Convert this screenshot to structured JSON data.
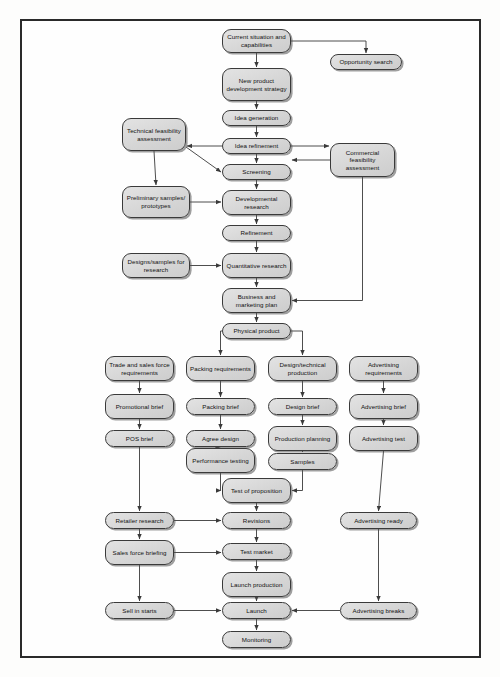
{
  "diagram": {
    "style": {
      "node_fill": "#d8d8d8",
      "node_border": "#3a3a3a",
      "frame_border": "#2a2a2a",
      "page_background": "#fdfdfc",
      "connector": "#3a3a3a"
    },
    "nodes": [
      {
        "id": "current_situation",
        "label": "Current situation and capabilities",
        "x": 222,
        "y": 29,
        "w": 69,
        "h": 24
      },
      {
        "id": "opportunity_search",
        "label": "Opportunity search",
        "x": 330,
        "y": 54,
        "w": 72,
        "h": 16
      },
      {
        "id": "npd_strategy",
        "label": "New product development strategy",
        "x": 222,
        "y": 68,
        "w": 69,
        "h": 33
      },
      {
        "id": "idea_generation",
        "label": "Idea generation",
        "x": 222,
        "y": 110,
        "w": 69,
        "h": 16
      },
      {
        "id": "technical_feas",
        "label": "Technical feasibility assessment",
        "x": 122,
        "y": 118,
        "w": 64,
        "h": 33
      },
      {
        "id": "idea_refinement",
        "label": "Idea refinement",
        "x": 222,
        "y": 138,
        "w": 69,
        "h": 16
      },
      {
        "id": "commercial_feas",
        "label": "Commercial feasibility assessment",
        "x": 330,
        "y": 143,
        "w": 65,
        "h": 34
      },
      {
        "id": "screening",
        "label": "Screening",
        "x": 222,
        "y": 164,
        "w": 69,
        "h": 16
      },
      {
        "id": "preliminary_samples",
        "label": "Preliminary samples/ prototypes",
        "x": 122,
        "y": 186,
        "w": 68,
        "h": 32
      },
      {
        "id": "developmental",
        "label": "Developmental research",
        "x": 222,
        "y": 190,
        "w": 69,
        "h": 25
      },
      {
        "id": "refinement",
        "label": "Refinement",
        "x": 222,
        "y": 225,
        "w": 69,
        "h": 16
      },
      {
        "id": "designs_samples",
        "label": "Designs/samples for research",
        "x": 122,
        "y": 253,
        "w": 68,
        "h": 25
      },
      {
        "id": "quantitative",
        "label": "Quantitative research",
        "x": 222,
        "y": 253,
        "w": 69,
        "h": 25
      },
      {
        "id": "business_plan",
        "label": "Business and marketing plan",
        "x": 222,
        "y": 288,
        "w": 69,
        "h": 25
      },
      {
        "id": "physical_product",
        "label": "Physical product",
        "x": 222,
        "y": 323,
        "w": 69,
        "h": 16
      },
      {
        "id": "trade_sales",
        "label": "Trade and sales force requirements",
        "x": 105,
        "y": 356,
        "w": 69,
        "h": 25
      },
      {
        "id": "packing_req",
        "label": "Packing requirements",
        "x": 186,
        "y": 356,
        "w": 69,
        "h": 25
      },
      {
        "id": "design_tech",
        "label": "Design/technical production",
        "x": 268,
        "y": 356,
        "w": 69,
        "h": 25
      },
      {
        "id": "advertising_req",
        "label": "Advertising requirements",
        "x": 349,
        "y": 356,
        "w": 69,
        "h": 25
      },
      {
        "id": "promotional_brief",
        "label": "Promotional brief",
        "x": 105,
        "y": 394,
        "w": 69,
        "h": 25
      },
      {
        "id": "packing_brief",
        "label": "Packing brief",
        "x": 186,
        "y": 398,
        "w": 69,
        "h": 17
      },
      {
        "id": "design_brief",
        "label": "Design brief",
        "x": 268,
        "y": 398,
        "w": 69,
        "h": 17
      },
      {
        "id": "advertising_brief",
        "label": "Advertising brief",
        "x": 349,
        "y": 394,
        "w": 69,
        "h": 25
      },
      {
        "id": "pos_brief",
        "label": "POS brief",
        "x": 105,
        "y": 430,
        "w": 69,
        "h": 17
      },
      {
        "id": "agree_design",
        "label": "Agree design",
        "x": 186,
        "y": 430,
        "w": 69,
        "h": 17
      },
      {
        "id": "production_planning",
        "label": "Production planning",
        "x": 268,
        "y": 426,
        "w": 69,
        "h": 25
      },
      {
        "id": "advertising_test",
        "label": "Advertising test",
        "x": 349,
        "y": 426,
        "w": 69,
        "h": 25
      },
      {
        "id": "performance_testing",
        "label": "Performance testing",
        "x": 186,
        "y": 448,
        "w": 69,
        "h": 25
      },
      {
        "id": "samples",
        "label": "Samples",
        "x": 268,
        "y": 453,
        "w": 69,
        "h": 17
      },
      {
        "id": "test_proposition",
        "label": "Test of proposition",
        "x": 222,
        "y": 478,
        "w": 69,
        "h": 25
      },
      {
        "id": "retailer_research",
        "label": "Retailer research",
        "x": 105,
        "y": 512,
        "w": 69,
        "h": 17
      },
      {
        "id": "revisions",
        "label": "Revisions",
        "x": 222,
        "y": 512,
        "w": 69,
        "h": 17
      },
      {
        "id": "advertising_ready",
        "label": "Advertising ready",
        "x": 340,
        "y": 512,
        "w": 77,
        "h": 17
      },
      {
        "id": "sales_force_brief",
        "label": "Sales force briefing",
        "x": 105,
        "y": 540,
        "w": 69,
        "h": 25
      },
      {
        "id": "test_market",
        "label": "Test market",
        "x": 222,
        "y": 543,
        "w": 69,
        "h": 17
      },
      {
        "id": "launch_production",
        "label": "Launch production",
        "x": 222,
        "y": 572,
        "w": 69,
        "h": 25
      },
      {
        "id": "sell_in_starts",
        "label": "Sell in starts",
        "x": 105,
        "y": 602,
        "w": 69,
        "h": 17
      },
      {
        "id": "launch",
        "label": "Launch",
        "x": 222,
        "y": 602,
        "w": 69,
        "h": 17
      },
      {
        "id": "advertising_breaks",
        "label": "Advertising breaks",
        "x": 340,
        "y": 602,
        "w": 77,
        "h": 17
      },
      {
        "id": "monitoring",
        "label": "Monitoring",
        "x": 222,
        "y": 631,
        "w": 69,
        "h": 17
      }
    ],
    "edges": [
      {
        "from": "current_situation",
        "to": "opportunity_search",
        "kind": "elbow-right-down"
      },
      {
        "from": "current_situation",
        "to": "npd_strategy",
        "kind": "down"
      },
      {
        "from": "npd_strategy",
        "to": "idea_generation",
        "kind": "down"
      },
      {
        "from": "idea_generation",
        "to": "idea_refinement",
        "kind": "down"
      },
      {
        "from": "idea_refinement",
        "to": "technical_feas",
        "kind": "left"
      },
      {
        "from": "idea_refinement",
        "to": "commercial_feas",
        "kind": "right"
      },
      {
        "from": "idea_refinement",
        "to": "screening",
        "kind": "down"
      },
      {
        "from": "technical_feas",
        "to": "screening",
        "kind": "diagonal"
      },
      {
        "from": "commercial_feas",
        "to": "screening",
        "kind": "left"
      },
      {
        "from": "technical_feas",
        "to": "preliminary_samples",
        "kind": "down"
      },
      {
        "from": "screening",
        "to": "developmental",
        "kind": "down"
      },
      {
        "from": "preliminary_samples",
        "to": "developmental",
        "kind": "right"
      },
      {
        "from": "developmental",
        "to": "refinement",
        "kind": "down"
      },
      {
        "from": "refinement",
        "to": "quantitative",
        "kind": "down"
      },
      {
        "from": "designs_samples",
        "to": "quantitative",
        "kind": "right"
      },
      {
        "from": "quantitative",
        "to": "business_plan",
        "kind": "down"
      },
      {
        "from": "commercial_feas",
        "to": "business_plan",
        "kind": "elbow-down-left"
      },
      {
        "from": "business_plan",
        "to": "physical_product",
        "kind": "down"
      },
      {
        "from": "physical_product",
        "to": "packing_req",
        "kind": "elbow-left-down"
      },
      {
        "from": "physical_product",
        "to": "design_tech",
        "kind": "elbow-right-down"
      },
      {
        "from": "trade_sales",
        "to": "promotional_brief",
        "kind": "down"
      },
      {
        "from": "promotional_brief",
        "to": "pos_brief",
        "kind": "down"
      },
      {
        "from": "pos_brief",
        "to": "retailer_research",
        "kind": "down"
      },
      {
        "from": "packing_req",
        "to": "packing_brief",
        "kind": "down"
      },
      {
        "from": "packing_brief",
        "to": "agree_design",
        "kind": "down"
      },
      {
        "from": "agree_design",
        "to": "performance_testing",
        "kind": "down"
      },
      {
        "from": "performance_testing",
        "to": "test_proposition",
        "kind": "elbow-down-right"
      },
      {
        "from": "design_tech",
        "to": "design_brief",
        "kind": "down"
      },
      {
        "from": "design_brief",
        "to": "production_planning",
        "kind": "down"
      },
      {
        "from": "production_planning",
        "to": "samples",
        "kind": "down"
      },
      {
        "from": "samples",
        "to": "test_proposition",
        "kind": "elbow-down-left"
      },
      {
        "from": "advertising_req",
        "to": "advertising_brief",
        "kind": "down"
      },
      {
        "from": "advertising_brief",
        "to": "advertising_test",
        "kind": "down"
      },
      {
        "from": "advertising_test",
        "to": "advertising_ready",
        "kind": "down"
      },
      {
        "from": "advertising_ready",
        "to": "advertising_breaks",
        "kind": "down"
      },
      {
        "from": "test_proposition",
        "to": "revisions",
        "kind": "down"
      },
      {
        "from": "retailer_research",
        "to": "revisions",
        "kind": "right"
      },
      {
        "from": "revisions",
        "to": "test_market",
        "kind": "down"
      },
      {
        "from": "sales_force_brief",
        "to": "test_market",
        "kind": "right"
      },
      {
        "from": "retailer_research",
        "to": "sales_force_brief",
        "kind": "down"
      },
      {
        "from": "sales_force_brief",
        "to": "sell_in_starts",
        "kind": "down"
      },
      {
        "from": "test_market",
        "to": "launch_production",
        "kind": "down"
      },
      {
        "from": "launch_production",
        "to": "launch",
        "kind": "down"
      },
      {
        "from": "sell_in_starts",
        "to": "launch",
        "kind": "right"
      },
      {
        "from": "advertising_breaks",
        "to": "launch",
        "kind": "left"
      },
      {
        "from": "launch",
        "to": "monitoring",
        "kind": "down"
      }
    ]
  }
}
